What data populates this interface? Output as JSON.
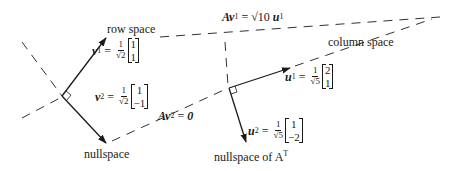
{
  "labels": {
    "row_space": "row space",
    "nullspace": "nullspace",
    "column_space": "column space",
    "nullspace_AT": "nullspace of A",
    "nullspace_AT_sup": "T"
  },
  "equations": {
    "v1": {
      "var": "v",
      "sub": "1",
      "eq": "=",
      "frac_num": "1",
      "frac_den": "√2",
      "vector": [
        "1",
        "1"
      ]
    },
    "v2": {
      "var": "v",
      "sub": "2",
      "eq": "=",
      "frac_num": "1",
      "frac_den": "√2",
      "vector": [
        "1",
        "−1"
      ]
    },
    "u1": {
      "var": "u",
      "sub": "1",
      "eq": "=",
      "frac_num": "1",
      "frac_den": "√5",
      "vector": [
        "2",
        "1"
      ]
    },
    "u2": {
      "var": "u",
      "sub": "2",
      "eq": "=",
      "frac_num": "1",
      "frac_den": "√5",
      "vector": [
        "1",
        "−2"
      ]
    },
    "Av1": {
      "lhs": "Av",
      "sub": "1",
      "eq": "= √10",
      "rhs": "u",
      "rhs_sub": "1"
    },
    "Av2": {
      "lhs": "Av",
      "sub": "2",
      "eq": "=",
      "rhs": "0"
    }
  }
}
